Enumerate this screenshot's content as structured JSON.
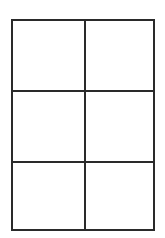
{
  "diagram": {
    "type": "grid",
    "rows": 3,
    "columns": 2,
    "line_color": "#2a2a2a",
    "background": "#ffffff",
    "cells": [
      {
        "row": 1,
        "col": 1,
        "label": ""
      },
      {
        "row": 1,
        "col": 2,
        "label": ""
      },
      {
        "row": 2,
        "col": 1,
        "label": ""
      },
      {
        "row": 2,
        "col": 2,
        "label": ""
      },
      {
        "row": 3,
        "col": 1,
        "label": ""
      },
      {
        "row": 3,
        "col": 2,
        "label": ""
      }
    ]
  }
}
